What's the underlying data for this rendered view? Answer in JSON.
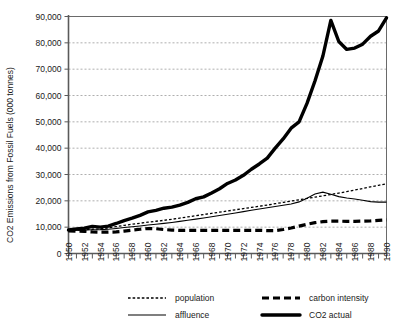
{
  "chart_data": {
    "type": "line",
    "title": "",
    "xlabel": "",
    "ylabel": "CO2 Emissions from Fossil Fuels (000 tonnes)",
    "xlim": [
      1950,
      1990
    ],
    "ylim": [
      0,
      90000
    ],
    "grid": true,
    "legend_position": "bottom",
    "y_ticks": [
      0,
      10000,
      20000,
      30000,
      40000,
      50000,
      60000,
      70000,
      80000,
      90000
    ],
    "y_tick_labels": [
      "0",
      "10,000",
      "20,000",
      "30,000",
      "40,000",
      "50,000",
      "60,000",
      "70,000",
      "80,000",
      "90,000"
    ],
    "x_ticks": [
      1950,
      1951,
      1952,
      1953,
      1954,
      1955,
      1956,
      1957,
      1958,
      1959,
      1960,
      1961,
      1962,
      1963,
      1964,
      1965,
      1966,
      1967,
      1968,
      1969,
      1970,
      1971,
      1972,
      1973,
      1974,
      1975,
      1976,
      1977,
      1978,
      1979,
      1980,
      1981,
      1982,
      1983,
      1984,
      1985,
      1986,
      1987,
      1988,
      1989,
      1990
    ],
    "x_tick_labels": [
      "1950",
      "1952",
      "1954",
      "1956",
      "1958",
      "1960",
      "1962",
      "1964",
      "1966",
      "1968",
      "1970",
      "1972",
      "1974",
      "1976",
      "1978",
      "1980",
      "1982",
      "1984",
      "1986",
      "1988",
      "1990"
    ],
    "x_tick_label_years": [
      1950,
      1952,
      1954,
      1956,
      1958,
      1960,
      1962,
      1964,
      1966,
      1968,
      1970,
      1972,
      1974,
      1976,
      1978,
      1980,
      1982,
      1984,
      1986,
      1988,
      1990
    ],
    "x": [
      1950,
      1951,
      1952,
      1953,
      1954,
      1955,
      1956,
      1957,
      1958,
      1959,
      1960,
      1961,
      1962,
      1963,
      1964,
      1965,
      1966,
      1967,
      1968,
      1969,
      1970,
      1971,
      1972,
      1973,
      1974,
      1975,
      1976,
      1977,
      1978,
      1979,
      1980,
      1981,
      1982,
      1983,
      1984,
      1985,
      1986,
      1987,
      1988,
      1989,
      1990
    ],
    "series": [
      {
        "name": "population",
        "style": "dotted",
        "values": [
          8800,
          8900,
          9050,
          9200,
          9400,
          9700,
          10200,
          10700,
          11100,
          11500,
          11900,
          12250,
          12600,
          13000,
          13450,
          13900,
          14350,
          14800,
          15250,
          15700,
          16150,
          16600,
          17050,
          17500,
          17950,
          18400,
          18900,
          19400,
          19900,
          20400,
          20900,
          21400,
          21900,
          22400,
          22950,
          23500,
          24100,
          24700,
          25300,
          25900,
          26500
        ]
      },
      {
        "name": "affluence",
        "style": "thin-solid",
        "values": [
          8800,
          8850,
          8950,
          9000,
          9050,
          9200,
          9500,
          9850,
          10150,
          10450,
          10800,
          11100,
          11450,
          11800,
          12200,
          12600,
          13050,
          13500,
          13950,
          14400,
          14900,
          15400,
          15900,
          16400,
          16900,
          17400,
          17850,
          18300,
          18800,
          19600,
          21000,
          22600,
          23300,
          22500,
          21600,
          21100,
          20700,
          20200,
          19700,
          19500,
          19500
        ]
      },
      {
        "name": "carbon intensity",
        "style": "thick-dashed",
        "values": [
          8600,
          8500,
          8400,
          8200,
          8100,
          8100,
          8200,
          8500,
          8900,
          9200,
          9500,
          9400,
          9100,
          8900,
          8800,
          8800,
          8800,
          8800,
          8800,
          8800,
          8800,
          8800,
          8800,
          8800,
          8800,
          8700,
          8700,
          9100,
          9700,
          10400,
          11100,
          11700,
          12100,
          12300,
          12300,
          12200,
          12200,
          12300,
          12400,
          12600,
          12800
        ]
      },
      {
        "name": "CO2 actual",
        "style": "thick-solid",
        "values": [
          8900,
          9300,
          9600,
          10300,
          10000,
          10400,
          11400,
          12500,
          13400,
          14500,
          15800,
          16400,
          17200,
          17600,
          18400,
          19400,
          20800,
          21500,
          23000,
          24600,
          26600,
          27900,
          29700,
          32000,
          34000,
          36200,
          40000,
          43500,
          47600,
          50000,
          57000,
          65500,
          75000,
          88500,
          80500,
          77500,
          78000,
          79500,
          82500,
          84500,
          89500
        ]
      }
    ],
    "legend": [
      {
        "label": "population",
        "style": "dotted"
      },
      {
        "label": "carbon intensity",
        "style": "thick-dashed"
      },
      {
        "label": "affluence",
        "style": "thin-solid"
      },
      {
        "label": "CO2 actual",
        "style": "thick-solid"
      }
    ],
    "colors": {
      "series": "#000000",
      "grid": "#9a9a9a",
      "axis": "#5a5a5a",
      "background": "#ffffff"
    }
  }
}
